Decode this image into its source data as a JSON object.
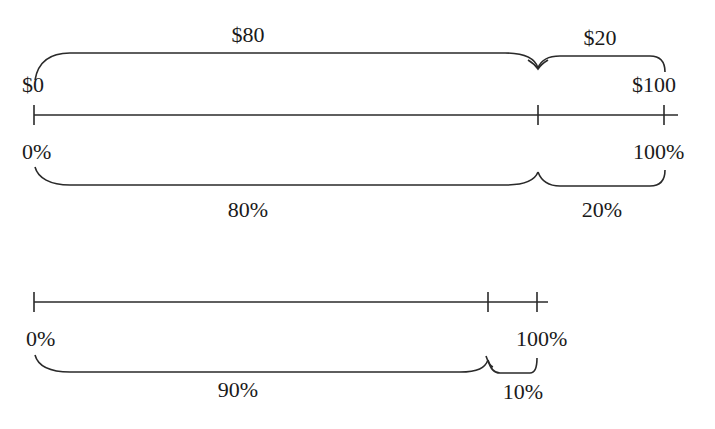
{
  "diagram": {
    "top": {
      "amount_labels": {
        "start": "$0",
        "end": "$100",
        "segment_a": "$80",
        "segment_b": "$20"
      },
      "percent_labels": {
        "start": "0%",
        "end": "100%",
        "segment_a": "80%",
        "segment_b": "20%"
      },
      "split_fraction": 0.8
    },
    "bottom": {
      "percent_labels": {
        "start": "0%",
        "end": "100%",
        "segment_a": "90%",
        "segment_b": "10%"
      },
      "split_fraction": 0.9
    },
    "colors": {
      "line": "#2a2a2a",
      "text": "#1a1a1a",
      "background": "#ffffff"
    }
  }
}
